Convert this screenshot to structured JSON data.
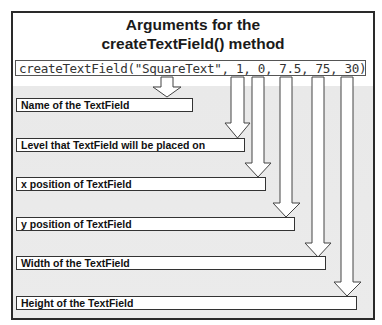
{
  "title": {
    "line1": "Arguments for the",
    "line2": "createTextField() method"
  },
  "code": "createTextField(\"SquareText\", 1, 0, 7.5, 75, 30);",
  "labels": [
    {
      "text": "Name of the TextField",
      "argument": "\"SquareText\""
    },
    {
      "text": "Level that TextField will be placed on",
      "argument": "1"
    },
    {
      "text": "x position of TextField",
      "argument": "0"
    },
    {
      "text": "y position of TextField",
      "argument": "7.5"
    },
    {
      "text": "Width of the TextField",
      "argument": "75"
    },
    {
      "text": "Height of the TextField",
      "argument": "30"
    }
  ],
  "colors": {
    "border": "#2a2a2a",
    "background_lower": "#e9e9e9",
    "arrow_fill": "#ffffff",
    "arrow_stroke": "#444444"
  }
}
